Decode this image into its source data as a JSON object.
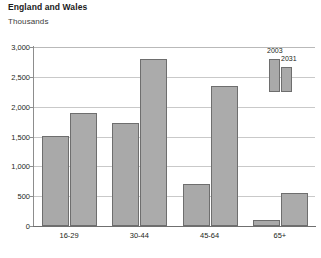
{
  "header": {
    "title": "England and Wales",
    "subtitle": "Thousands"
  },
  "chart_data": {
    "type": "bar",
    "title": "England and Wales",
    "subtitle": "Thousands",
    "xlabel": "",
    "ylabel": "Thousands",
    "ylim": [
      0,
      3000
    ],
    "ytick_labels": [
      "3,000",
      "2,500",
      "2,000",
      "1,500",
      "1,000",
      "500",
      "0"
    ],
    "ytick_values": [
      3000,
      2500,
      2000,
      1500,
      1000,
      500,
      0
    ],
    "grid": true,
    "legend_position": "top-right",
    "categories": [
      "16-29",
      "30-44",
      "45-64",
      "65+"
    ],
    "series": [
      {
        "name": "2003",
        "color": "#a9a9a9",
        "values": [
          1510,
          1720,
          700,
          100
        ]
      },
      {
        "name": "2031",
        "color": "#ababab",
        "values": [
          1900,
          2800,
          2350,
          550
        ]
      }
    ]
  }
}
